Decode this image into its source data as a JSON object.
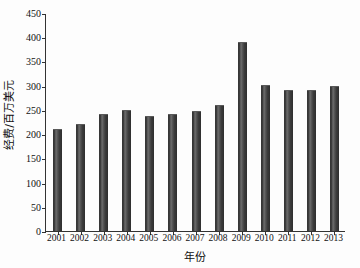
{
  "chart_data": {
    "type": "bar",
    "title": "",
    "xlabel": "年份",
    "ylabel": "经费/百万美元",
    "categories": [
      "2001",
      "2002",
      "2003",
      "2004",
      "2005",
      "2006",
      "2007",
      "2008",
      "2009",
      "2010",
      "2011",
      "2012",
      "2013"
    ],
    "values": [
      211,
      221,
      242,
      250,
      238,
      241,
      247,
      261,
      390,
      301,
      291,
      291,
      300
    ],
    "ylim": [
      0,
      450
    ],
    "yticks": [
      0,
      50,
      100,
      150,
      200,
      250,
      300,
      350,
      400,
      450
    ],
    "ytick_labels": [
      "0",
      "50",
      "100",
      "150",
      "200",
      "250",
      "300",
      "350",
      "400",
      "450"
    ],
    "grid": false,
    "legend": false,
    "bar_color": "#3a3a3a",
    "axis_color": "#333333",
    "background": "#fdfdfd"
  }
}
